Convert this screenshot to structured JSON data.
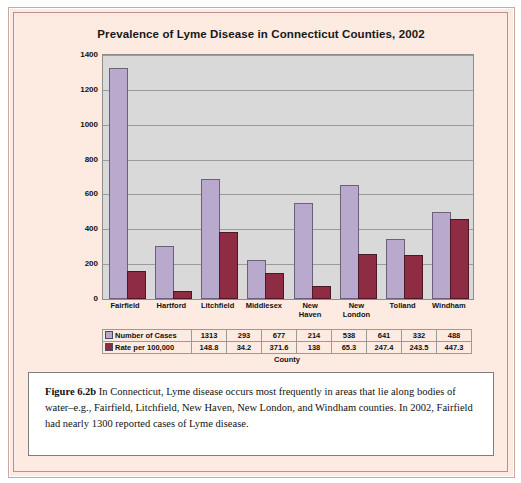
{
  "figure": {
    "label": "Figure 6.2b",
    "caption_text": "  In Connecticut, Lyme disease occurs most frequently in areas that lie along bodies of water–e.g., Fairfield, Litchfield, New Haven, New London, and Windham counties. In 2002, Fairfield had nearly 1300 reported cases of Lyme disease."
  },
  "chart_data": {
    "type": "bar",
    "title": "Prevalence of Lyme Disease in Connecticut Counties, 2002",
    "xlabel": "County",
    "ylabel": "",
    "ylim": [
      0,
      1400
    ],
    "yticks": [
      0,
      200,
      400,
      600,
      800,
      1000,
      1200,
      1400
    ],
    "ytick_labels": [
      "0",
      "200",
      "400",
      "600",
      "800",
      "1000",
      "1200",
      "1400"
    ],
    "grid": true,
    "legend_position": "table-left",
    "categories": [
      "Fairfield",
      "Hartford",
      "Litchfield",
      "Middlesex",
      "New Haven",
      "New London",
      "Tolland",
      "Windham"
    ],
    "series": [
      {
        "name": "Number of Cases",
        "color": "#b9a9cd",
        "values": [
          1313,
          293,
          677,
          214,
          538,
          641,
          332,
          488
        ]
      },
      {
        "name": "Rate per 100,000",
        "color": "#8e2c44",
        "values": [
          148.8,
          34.2,
          371.6,
          138,
          65.3,
          247.4,
          243.5,
          447.3
        ]
      }
    ],
    "table": {
      "row_headers": [
        "Number of Cases",
        "Rate per 100,000"
      ],
      "rows": [
        [
          "1313",
          "293",
          "677",
          "214",
          "538",
          "641",
          "332",
          "488"
        ],
        [
          "148.8",
          "34.2",
          "371.6",
          "138",
          "65.3",
          "247.4",
          "243.5",
          "447.3"
        ]
      ]
    }
  }
}
